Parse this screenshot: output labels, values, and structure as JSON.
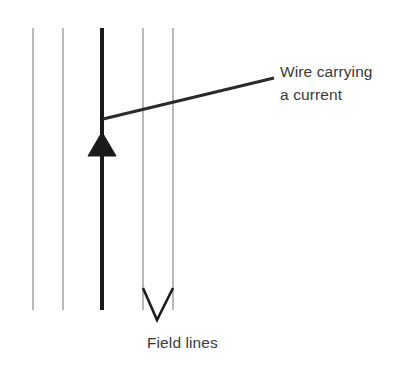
{
  "figure": {
    "background_color": "#ffffff",
    "width": 408,
    "height": 376
  },
  "labels": {
    "wire": {
      "line1": "Wire carrying",
      "line2": "a current",
      "text": "Wire carrying\na current",
      "color": "#3a3a3a",
      "font_size_px": 15.5,
      "x": 280,
      "y": 60
    },
    "field_lines": {
      "text": "Field lines",
      "color": "#3a3a3a",
      "font_size_px": 15.5,
      "x": 147,
      "y": 331
    }
  },
  "graphics": {
    "field_lines": {
      "name": "field-lines",
      "count": 4,
      "color": "#8a8a8a",
      "stroke_width": 1.2,
      "y_top": 28,
      "y_bottom": 310,
      "x_positions": [
        33,
        63,
        143,
        173
      ]
    },
    "wire": {
      "name": "current-carrying-wire",
      "color": "#1a1a1a",
      "stroke_width": 4,
      "x": 102,
      "y_top": 28,
      "y_bottom": 310,
      "direction": "up"
    },
    "current_arrowhead": {
      "name": "current-direction-arrowhead",
      "color": "#1a1a1a",
      "tip_x": 102,
      "tip_y": 132,
      "base_y": 156,
      "half_width": 14,
      "points": "102,132 116,156 88,156"
    },
    "field_direction_arrowhead": {
      "name": "field-direction-arrowhead",
      "color": "#1a1a1a",
      "stroke_width": 2.6,
      "points": "143,288 157,320 173,288",
      "tip_x": 157,
      "tip_y": 320
    },
    "leader_line": {
      "name": "wire-label-leader-line",
      "color": "#2a2a2a",
      "stroke_width": 3,
      "x1": 103,
      "y1": 119,
      "x2": 274,
      "y2": 78
    }
  }
}
